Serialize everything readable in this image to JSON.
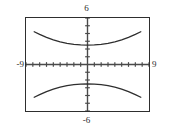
{
  "window": {
    "ymax_label": "6",
    "ymin_label": "-6",
    "xmin_label": "-9",
    "xmax_label": "9"
  },
  "chart_data": {
    "type": "line",
    "title": "",
    "subtitle": "",
    "xlabel": "",
    "ylabel": "",
    "xlim": [
      -9,
      9
    ],
    "ylim": [
      -6,
      6
    ],
    "grid": false,
    "legend": "none",
    "axes": {
      "x_axis_at_y": 0,
      "y_axis_at_x": 0,
      "x_tick_interval": 1,
      "y_tick_interval": 1,
      "x_tick_values": [
        -9,
        -8,
        -7,
        -6,
        -5,
        -4,
        -3,
        -2,
        -1,
        1,
        2,
        3,
        4,
        5,
        6,
        7,
        8,
        9
      ],
      "y_tick_values": [
        -6,
        -5,
        -4,
        -3,
        -2,
        -1,
        1,
        2,
        3,
        4,
        5,
        6
      ],
      "tick_style": "hash-marks"
    },
    "annotations": [
      "Graphing-calculator viewport with window -9 to 9 horizontally and -6 to 6 vertically",
      "Vertical hyperbola: two branches opening up and down, vertices on the y-axis"
    ],
    "curve_description": "vertical hyperbola y^2/a^2 - x^2/b^2 = 1 with a = 1.5, b = 3",
    "upper_branch_vertex": [
      0,
      1.5
    ],
    "lower_branch_vertex": [
      0,
      -1.5
    ],
    "series": [
      {
        "name": "upper-branch",
        "x": [
          -7.8,
          -7.0,
          -6.0,
          -5.0,
          -4.0,
          -3.0,
          -2.0,
          -1.0,
          0.0,
          1.0,
          2.0,
          3.0,
          4.0,
          5.0,
          6.0,
          7.0,
          7.8
        ],
        "y": [
          4.23,
          3.89,
          3.51,
          3.18,
          2.92,
          2.72,
          2.59,
          2.52,
          2.5,
          2.52,
          2.59,
          2.72,
          2.92,
          3.18,
          3.51,
          3.89,
          4.23
        ]
      },
      {
        "name": "lower-branch",
        "x": [
          -7.8,
          -7.0,
          -6.0,
          -5.0,
          -4.0,
          -3.0,
          -2.0,
          -1.0,
          0.0,
          1.0,
          2.0,
          3.0,
          4.0,
          5.0,
          6.0,
          7.0,
          7.8
        ],
        "y": [
          -4.23,
          -3.89,
          -3.51,
          -3.18,
          -2.92,
          -2.72,
          -2.59,
          -2.52,
          -2.5,
          -2.52,
          -2.59,
          -2.72,
          -2.92,
          -3.18,
          -3.51,
          -3.89,
          -4.23
        ]
      }
    ],
    "colors": {
      "curve": "#2e2e2e",
      "axis": "#4a4a4a",
      "frame": "#2e2e2e",
      "background": "#ffffff",
      "label_text": "#2b2b2b"
    }
  }
}
